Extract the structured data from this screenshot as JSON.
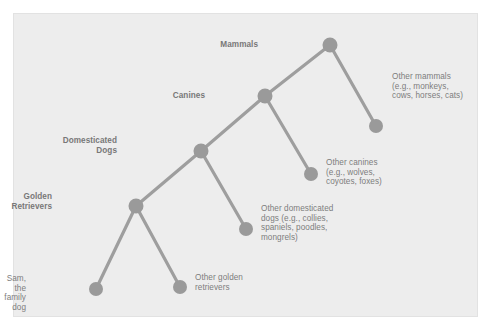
{
  "figure": {
    "type": "hierarchical-tree-diagram",
    "panel_background": "#ededed",
    "node_color": "#9a9a9a",
    "edge_color": "#9e9e9e",
    "text_color": "#7d7d7d"
  },
  "chart_data": {
    "type": "diagram",
    "title": "",
    "nodes": [
      {
        "id": "mammals",
        "label": "Mammals",
        "x": 330,
        "y": 45,
        "r": 7.5,
        "style": "bold",
        "label_align": "right",
        "label_x": 258,
        "label_y": 40
      },
      {
        "id": "other-mammals",
        "label": "Other mammals\n(e.g., monkeys,\ncows, horses, cats)",
        "x": 376,
        "y": 126,
        "r": 7.0,
        "style": "regular",
        "label_align": "left",
        "label_x": 392,
        "label_y": 72
      },
      {
        "id": "canines",
        "label": "Canines",
        "x": 265,
        "y": 96,
        "r": 7.5,
        "style": "bold",
        "label_align": "right",
        "label_x": 205,
        "label_y": 91
      },
      {
        "id": "other-canines",
        "label": "Other canines\n(e.g., wolves,\ncoyotes, foxes)",
        "x": 311,
        "y": 174,
        "r": 7.0,
        "style": "regular",
        "label_align": "left",
        "label_x": 326,
        "label_y": 158
      },
      {
        "id": "domesticated-dogs",
        "label": "Domesticated\nDogs",
        "x": 201,
        "y": 151,
        "r": 7.5,
        "style": "bold",
        "label_align": "right",
        "label_x": 117,
        "label_y": 136
      },
      {
        "id": "other-domesticated-dogs",
        "label": "Other domesticated\ndogs (e.g., collies,\nspaniels, poodles,\nmongrels)",
        "x": 246,
        "y": 229,
        "r": 7.0,
        "style": "regular",
        "label_align": "left",
        "label_x": 261,
        "label_y": 204
      },
      {
        "id": "golden-retrievers",
        "label": "Golden\nRetrievers",
        "x": 136,
        "y": 206,
        "r": 7.5,
        "style": "bold",
        "label_align": "right",
        "label_x": 52,
        "label_y": 192
      },
      {
        "id": "sam-family-dog",
        "label": "Sam, the\nfamily dog",
        "x": 96,
        "y": 289,
        "r": 7.0,
        "style": "regular",
        "label_align": "right",
        "label_x": 26,
        "label_y": 274
      },
      {
        "id": "other-golden-retrievers",
        "label": "Other golden\nretrievers",
        "x": 180,
        "y": 287,
        "r": 7.0,
        "style": "regular",
        "label_align": "left",
        "label_x": 195,
        "label_y": 273
      }
    ],
    "edges": [
      {
        "from": "mammals",
        "to": "other-mammals"
      },
      {
        "from": "mammals",
        "to": "canines"
      },
      {
        "from": "canines",
        "to": "other-canines"
      },
      {
        "from": "canines",
        "to": "domesticated-dogs"
      },
      {
        "from": "domesticated-dogs",
        "to": "other-domesticated-dogs"
      },
      {
        "from": "domesticated-dogs",
        "to": "golden-retrievers"
      },
      {
        "from": "golden-retrievers",
        "to": "sam-family-dog"
      },
      {
        "from": "golden-retrievers",
        "to": "other-golden-retrievers"
      }
    ],
    "labels": {
      "mammals": "Mammals",
      "other_mammals": "Other mammals\n(e.g., monkeys,\ncows, horses, cats)",
      "canines": "Canines",
      "other_canines": "Other canines\n(e.g., wolves,\ncoyotes, foxes)",
      "domesticated_dogs": "Domesticated\nDogs",
      "other_domesticated_dogs": "Other domesticated\ndogs (e.g., collies,\nspaniels, poodles,\nmongrels)",
      "golden_retrievers": "Golden\nRetrievers",
      "sam_family_dog": "Sam, the\nfamily dog",
      "other_golden_retrievers": "Other golden\nretrievers"
    }
  }
}
